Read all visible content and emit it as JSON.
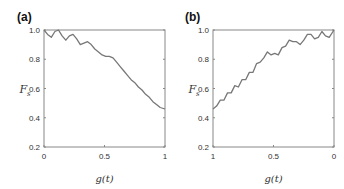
{
  "chart_data": [
    {
      "type": "line",
      "panel_label": "(a)",
      "xlabel": "g(t)",
      "ylabel": "F_s",
      "xlim": [
        0,
        1
      ],
      "ylim": [
        0.2,
        1.0
      ],
      "x_ticks": [
        "0",
        "0.5",
        "1"
      ],
      "y_ticks": [
        "0.2",
        "0.4",
        "0.6",
        "0.8",
        "1.0"
      ],
      "grid": false,
      "x": [
        0,
        0.03,
        0.06,
        0.09,
        0.12,
        0.15,
        0.18,
        0.21,
        0.24,
        0.27,
        0.3,
        0.33,
        0.36,
        0.39,
        0.42,
        0.45,
        0.48,
        0.51,
        0.54,
        0.57,
        0.6,
        0.63,
        0.66,
        0.69,
        0.72,
        0.75,
        0.78,
        0.81,
        0.84,
        0.87,
        0.9,
        0.93,
        0.96,
        1.0
      ],
      "values": [
        1.0,
        0.97,
        0.95,
        0.99,
        1.0,
        0.96,
        0.93,
        0.96,
        0.97,
        0.94,
        0.9,
        0.91,
        0.92,
        0.9,
        0.87,
        0.85,
        0.83,
        0.82,
        0.82,
        0.81,
        0.78,
        0.75,
        0.72,
        0.69,
        0.66,
        0.64,
        0.61,
        0.59,
        0.56,
        0.54,
        0.51,
        0.49,
        0.47,
        0.46
      ]
    },
    {
      "type": "line",
      "panel_label": "(b)",
      "xlabel": "g(t)",
      "ylabel": "F_s",
      "xlim": [
        1,
        0
      ],
      "ylim": [
        0.2,
        1.0
      ],
      "x_ticks": [
        "1",
        "0.5",
        "0"
      ],
      "y_ticks": [
        "0.2",
        "0.4",
        "0.6",
        "0.8",
        "1.0"
      ],
      "grid": false,
      "x": [
        1.0,
        0.97,
        0.94,
        0.91,
        0.88,
        0.85,
        0.82,
        0.79,
        0.76,
        0.73,
        0.7,
        0.67,
        0.64,
        0.61,
        0.58,
        0.55,
        0.52,
        0.49,
        0.46,
        0.43,
        0.4,
        0.37,
        0.34,
        0.31,
        0.28,
        0.25,
        0.22,
        0.19,
        0.16,
        0.13,
        0.1,
        0.07,
        0.04,
        0.0
      ],
      "values": [
        0.46,
        0.48,
        0.52,
        0.52,
        0.57,
        0.57,
        0.62,
        0.61,
        0.66,
        0.66,
        0.71,
        0.71,
        0.77,
        0.78,
        0.81,
        0.85,
        0.83,
        0.84,
        0.83,
        0.88,
        0.89,
        0.93,
        0.92,
        0.92,
        0.9,
        0.93,
        0.97,
        0.97,
        0.94,
        0.95,
        0.99,
        0.96,
        0.95,
        1.0
      ]
    }
  ]
}
